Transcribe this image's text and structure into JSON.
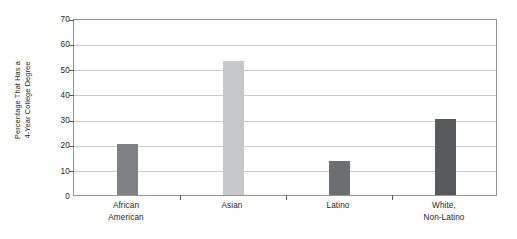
{
  "chart_data": {
    "type": "bar",
    "title": "",
    "xlabel": "",
    "ylabel": "Percentage That Has a 4-Year College Degree",
    "ylabel_line1": "Percentage That Has a",
    "ylabel_line2": "4-Year College Degree",
    "categories": [
      "African American",
      "Asian",
      "Latino",
      "White, Non-Latino"
    ],
    "category_lines": [
      {
        "line1": "African",
        "line2": "American"
      },
      {
        "line1": "Asian",
        "line2": ""
      },
      {
        "line1": "Latino",
        "line2": ""
      },
      {
        "line1": "White,",
        "line2": "Non-Latino"
      }
    ],
    "values": [
      20,
      53,
      13.5,
      30
    ],
    "bar_colors": [
      "#808285",
      "#c7c8ca",
      "#6d6e71",
      "#58595b"
    ],
    "ylim": [
      0,
      70
    ],
    "yticks": [
      0,
      10,
      20,
      30,
      40,
      50,
      60,
      70
    ],
    "ytick_labels": [
      "0",
      "10",
      "20",
      "30",
      "40",
      "50",
      "60",
      "70"
    ],
    "grid": true,
    "legend": "none",
    "frame_color": "#939598",
    "gridline_color": "#c9cacc",
    "text_color": "#231f20",
    "background": "#ffffff"
  }
}
